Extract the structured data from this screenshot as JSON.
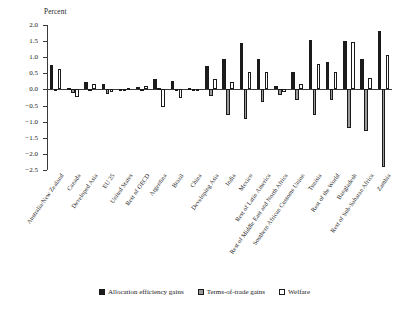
{
  "chart_data": {
    "type": "bar",
    "title": "",
    "ylabel": "Percent",
    "xlabel": "",
    "ylim": [
      -2.5,
      2.0
    ],
    "ytick_labels": [
      "2.0",
      "1.5",
      "1.0",
      "0.5",
      "0.0",
      "−0.5",
      "−1.0",
      "−1.5",
      "−2.0",
      "−2.5"
    ],
    "ytick_values": [
      2.0,
      1.5,
      1.0,
      0.5,
      0.0,
      -0.5,
      -1.0,
      -1.5,
      -2.0,
      -2.5
    ],
    "grid": false,
    "legend_position": "bottom",
    "categories": [
      "Australia/New Zealand",
      "Canada",
      "Developed Asia",
      "EU 25",
      "United States",
      "Rest of OECD",
      "Argentina",
      "Brazil",
      "China",
      "Developing Asia",
      "India",
      "Mexico",
      "Rest of Latin America",
      "Rest of Middle East and North Africa",
      "Southern African Customs Union",
      "Tunisia",
      "Rest of the World",
      "Bangladesh",
      "Rest of Sub-Saharan Africa",
      "Zambia"
    ],
    "series": [
      {
        "name": "Allocation efficiency gains",
        "color": "#1c1c1c",
        "values": [
          0.75,
          0.05,
          0.22,
          0.17,
          0.02,
          0.08,
          0.33,
          0.25,
          0.03,
          0.72,
          0.96,
          1.45,
          0.95,
          0.1,
          0.54,
          1.52,
          0.85,
          1.5,
          0.95,
          1.8
        ]
      },
      {
        "name": "Terms-of-trade gains",
        "color": "#9a9a9a",
        "values": [
          -0.02,
          -0.1,
          0.02,
          -0.13,
          -0.02,
          0.02,
          0.05,
          -0.06,
          -0.06,
          -0.2,
          -0.78,
          -0.92,
          -0.4,
          -0.16,
          -0.33,
          -0.78,
          -0.32,
          -1.2,
          -1.3,
          -2.4
        ]
      },
      {
        "name": "Welfare",
        "color": "#ffffff",
        "values": [
          0.62,
          -0.25,
          0.17,
          -0.08,
          0.06,
          0.1,
          -0.55,
          -0.27,
          -0.05,
          0.32,
          0.23,
          0.55,
          0.53,
          -0.08,
          0.18,
          0.78,
          0.55,
          1.47,
          0.35,
          1.07
        ]
      }
    ]
  },
  "legend": {
    "items": [
      {
        "label": "Allocation efficiency gains",
        "swatch": "black-square"
      },
      {
        "label": "Terms-of-trade gains",
        "swatch": "gray-square"
      },
      {
        "label": "Welfare",
        "swatch": "white-square"
      }
    ]
  }
}
